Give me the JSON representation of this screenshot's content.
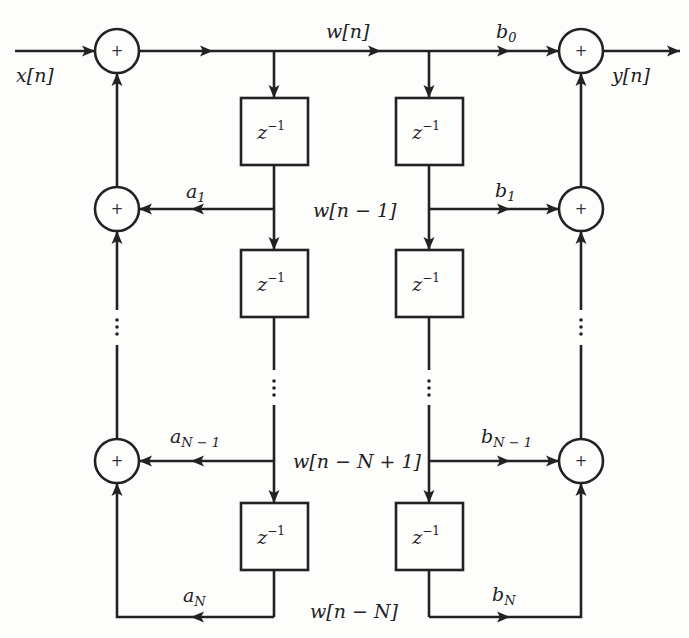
{
  "diagram": {
    "type": "signal-flow-graph",
    "structure": "Direct Form II IIR filter",
    "input_label": "x[n]",
    "output_label": "y[n]",
    "adder_symbol": "+",
    "delay_label": "z",
    "delay_exponent": "−1",
    "state_labels": {
      "w0": "w[n]",
      "w1": "w[n − 1]",
      "wN1": "w[n − N + 1]",
      "wN": "w[n − N]"
    },
    "feedback_coeffs": {
      "a1": {
        "base": "a",
        "sub": "1"
      },
      "aN1": {
        "base": "a",
        "sub": "N − 1"
      },
      "aN": {
        "base": "a",
        "sub": "N"
      }
    },
    "feedforward_coeffs": {
      "b0": {
        "base": "b",
        "sub": "0"
      },
      "b1": {
        "base": "b",
        "sub": "1"
      },
      "bN1": {
        "base": "b",
        "sub": "N − 1"
      },
      "bN": {
        "base": "b",
        "sub": "N"
      }
    },
    "ellipsis": "⋮"
  }
}
